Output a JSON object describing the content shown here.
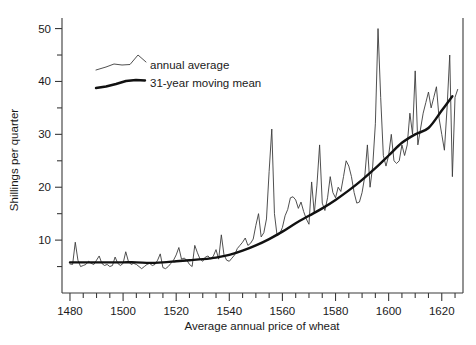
{
  "chart_data": {
    "type": "line",
    "title": "",
    "xlabel": "Average annual price of wheat",
    "ylabel": "Shillings per quarter",
    "xlim": [
      1477,
      1628
    ],
    "ylim": [
      0,
      52
    ],
    "grid": false,
    "legend_position": "top-left-inside",
    "x_ticks_major": [
      1480,
      1500,
      1520,
      1540,
      1560,
      1580,
      1600,
      1620
    ],
    "x_tick_labels": [
      "1480",
      "1500",
      "1520",
      "1540",
      "1560",
      "1580",
      "1600",
      "1620"
    ],
    "x_tick_minor_step": 5,
    "y_ticks_major": [
      10,
      20,
      30,
      40,
      50
    ],
    "y_tick_labels": [
      "10",
      "20",
      "30",
      "40",
      "50"
    ],
    "y_tick_minor": [
      5,
      15,
      25,
      35,
      45
    ],
    "series": [
      {
        "name": "annual average",
        "style": "thin",
        "color": "#3c3c3c",
        "x": [
          1480,
          1481,
          1482,
          1483,
          1484,
          1485,
          1486,
          1487,
          1488,
          1489,
          1490,
          1491,
          1492,
          1493,
          1494,
          1495,
          1496,
          1497,
          1498,
          1499,
          1500,
          1501,
          1502,
          1503,
          1504,
          1505,
          1506,
          1507,
          1508,
          1509,
          1510,
          1511,
          1512,
          1513,
          1514,
          1515,
          1516,
          1517,
          1518,
          1519,
          1520,
          1521,
          1522,
          1523,
          1524,
          1525,
          1526,
          1527,
          1528,
          1529,
          1530,
          1531,
          1532,
          1533,
          1534,
          1535,
          1536,
          1537,
          1538,
          1539,
          1540,
          1541,
          1542,
          1543,
          1544,
          1545,
          1546,
          1547,
          1548,
          1549,
          1550,
          1551,
          1552,
          1553,
          1554,
          1555,
          1556,
          1557,
          1558,
          1559,
          1560,
          1561,
          1562,
          1563,
          1564,
          1565,
          1566,
          1567,
          1568,
          1569,
          1570,
          1571,
          1572,
          1573,
          1574,
          1575,
          1576,
          1577,
          1578,
          1579,
          1580,
          1581,
          1582,
          1583,
          1584,
          1585,
          1586,
          1587,
          1588,
          1589,
          1590,
          1591,
          1592,
          1593,
          1594,
          1595,
          1596,
          1597,
          1598,
          1599,
          1600,
          1601,
          1602,
          1603,
          1604,
          1605,
          1606,
          1607,
          1608,
          1609,
          1610,
          1611,
          1612,
          1613,
          1614,
          1615,
          1616,
          1617,
          1618,
          1619,
          1620,
          1621,
          1622,
          1623,
          1624,
          1625,
          1626
        ],
        "values": [
          5.5,
          5.4,
          9.6,
          6.2,
          5.0,
          5.2,
          5.4,
          6.0,
          5.6,
          5.4,
          6.2,
          7.0,
          5.6,
          5.2,
          5.4,
          5.0,
          5.2,
          6.8,
          5.6,
          5.2,
          5.6,
          7.8,
          6.0,
          5.4,
          5.6,
          5.4,
          5.0,
          4.6,
          5.0,
          5.4,
          5.6,
          5.2,
          5.4,
          6.2,
          7.4,
          4.8,
          4.6,
          5.0,
          5.6,
          6.2,
          7.2,
          8.6,
          6.4,
          6.6,
          6.2,
          5.4,
          5.0,
          9.0,
          7.6,
          6.4,
          6.0,
          6.8,
          7.0,
          6.4,
          7.0,
          8.2,
          6.4,
          11.0,
          7.2,
          6.2,
          6.0,
          6.6,
          7.2,
          8.4,
          9.0,
          9.6,
          10.4,
          9.0,
          9.4,
          10.2,
          12.8,
          15.0,
          10.6,
          11.4,
          14.0,
          23.0,
          31.0,
          15.0,
          10.8,
          11.2,
          12.4,
          14.6,
          15.8,
          18.0,
          18.2,
          17.6,
          16.0,
          17.2,
          15.4,
          14.0,
          13.0,
          21.0,
          15.0,
          20.4,
          28.0,
          17.0,
          15.6,
          18.0,
          22.0,
          19.0,
          18.0,
          20.0,
          19.2,
          22.0,
          25.0,
          24.0,
          22.0,
          19.0,
          17.0,
          17.2,
          19.0,
          22.0,
          28.0,
          20.0,
          24.0,
          32.0,
          50.0,
          37.0,
          26.0,
          24.0,
          26.0,
          30.0,
          25.0,
          24.5,
          25.0,
          28.0,
          26.0,
          28.0,
          34.0,
          30.0,
          42.0,
          28.0,
          31.0,
          34.0,
          36.0,
          38.0,
          35.0,
          37.0,
          39.0,
          33.0,
          30.0,
          27.0,
          35.0,
          45.0,
          22.0,
          37.0,
          38.5
        ]
      },
      {
        "name": "31-year moving mean",
        "style": "thick",
        "color": "#111111",
        "x": [
          1480,
          1485,
          1490,
          1495,
          1500,
          1505,
          1510,
          1515,
          1520,
          1525,
          1530,
          1535,
          1540,
          1545,
          1550,
          1555,
          1560,
          1565,
          1570,
          1575,
          1580,
          1585,
          1590,
          1595,
          1600,
          1605,
          1610,
          1615,
          1620,
          1624
        ],
        "values": [
          5.8,
          5.8,
          5.8,
          5.8,
          5.8,
          5.8,
          5.7,
          5.8,
          6.0,
          6.2,
          6.4,
          6.7,
          7.2,
          8.0,
          9.0,
          10.2,
          11.6,
          13.2,
          14.6,
          16.0,
          17.6,
          19.4,
          21.4,
          23.6,
          26.0,
          28.4,
          30.0,
          31.2,
          34.5,
          37.2
        ]
      }
    ],
    "legend": [
      {
        "label": "annual average",
        "style": "thin"
      },
      {
        "label": "31-year moving mean",
        "style": "thick"
      }
    ]
  }
}
